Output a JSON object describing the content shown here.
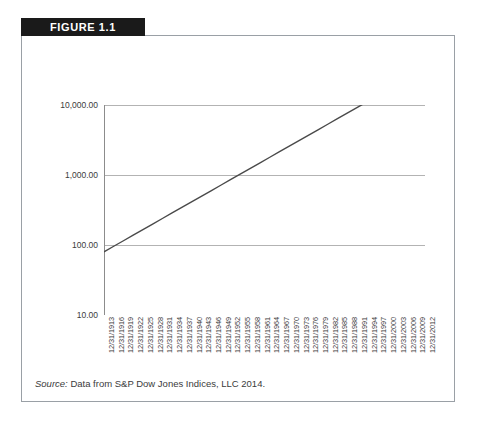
{
  "figure": {
    "banner_label": "FIGURE 1.1",
    "source_label": "Source:",
    "source_text": " Data from S&P Dow Jones Indices, LLC 2014."
  },
  "colors": {
    "banner_bg": "#1a1a1a",
    "banner_text": "#ffffff",
    "card_border": "#9aa0a6",
    "gridline": "#b3b3b3",
    "axis": "#8c8c8c",
    "series_line": "#4a4a4a",
    "tick_text": "#3b3b3b"
  },
  "chart_data": {
    "type": "line",
    "title": "",
    "xlabel": "",
    "ylabel": "",
    "yscale": "log",
    "ylim": [
      10,
      100000
    ],
    "grid": true,
    "legend": "none",
    "y_ticks": [
      "10.00",
      "100.00",
      "1,000.00",
      "10,000.00"
    ],
    "y_tick_values": [
      10,
      100,
      1000,
      10000
    ],
    "categories": [
      "12/31/1913",
      "12/31/1916",
      "12/31/1919",
      "12/31/1922",
      "12/31/1925",
      "12/31/1928",
      "12/31/1931",
      "12/31/1934",
      "12/31/1937",
      "12/31/1940",
      "12/31/1943",
      "12/31/1946",
      "12/31/1949",
      "12/31/1952",
      "12/31/1955",
      "12/31/1958",
      "12/31/1961",
      "12/31/1964",
      "12/31/1967",
      "12/31/1970",
      "12/31/1973",
      "12/31/1976",
      "12/31/1979",
      "12/31/1982",
      "12/31/1985",
      "12/31/1988",
      "12/31/1991",
      "12/31/1994",
      "12/31/1997",
      "12/31/2000",
      "12/31/2003",
      "12/31/2006",
      "12/31/2009",
      "12/31/2012"
    ],
    "series": [
      {
        "name": "S&P Dow Jones index growth",
        "values": [
          80,
          96,
          115,
          138,
          166,
          199,
          239,
          287,
          344,
          413,
          496,
          595,
          714,
          857,
          1029,
          1235,
          1482,
          1778,
          2134,
          2561,
          3073,
          3688,
          4426,
          5311,
          6373,
          7648,
          9178,
          11013,
          13216,
          15859,
          19031,
          22837,
          27404,
          32885
        ]
      }
    ]
  }
}
